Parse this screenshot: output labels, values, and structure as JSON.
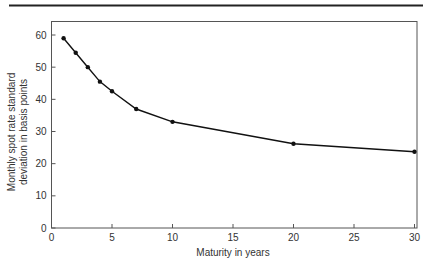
{
  "chart_data": {
    "type": "line",
    "title": "",
    "xlabel": "Maturity in years",
    "ylabel_lines": [
      "Monthly spot rate standard",
      "deviation in basis points"
    ],
    "ylabel": "Monthly spot rate standard deviation in basis points",
    "x": [
      1,
      2,
      3,
      4,
      5,
      7,
      10,
      20,
      30
    ],
    "series": [
      {
        "name": "Spot rate standard deviation",
        "values": [
          59,
          54.5,
          50,
          45.5,
          42.5,
          37,
          33,
          26.2,
          23.7
        ]
      }
    ],
    "xlim": [
      0,
      30
    ],
    "ylim": [
      0,
      65
    ],
    "xticks": [
      0,
      5,
      10,
      15,
      20,
      25,
      30
    ],
    "yticks": [
      0,
      10,
      20,
      30,
      40,
      50,
      60
    ],
    "grid": false,
    "legend": "none",
    "markers": true
  }
}
